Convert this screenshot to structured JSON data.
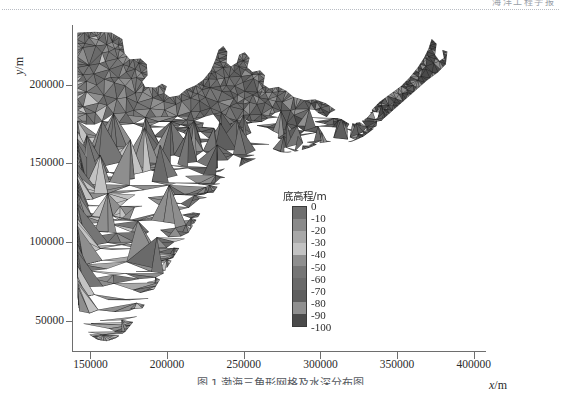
{
  "header": {
    "running_head": "海洋工程学报"
  },
  "figure": {
    "caption": "图 1  渤海三角形网格及水深分布图"
  },
  "axes": {
    "x_axis_title": "x",
    "x_axis_unit": "/m",
    "y_axis_title": "y",
    "y_axis_unit": "/m",
    "x_ticks": [
      "150000",
      "200000",
      "250000",
      "300000",
      "350000",
      "400000"
    ],
    "x_tick_values": [
      150000,
      200000,
      250000,
      300000,
      350000,
      400000
    ],
    "y_ticks": [
      "50000",
      "100000",
      "150000",
      "200000"
    ],
    "y_tick_values": [
      50000,
      100000,
      150000,
      200000
    ],
    "x_range": [
      138000,
      408000
    ],
    "y_range": [
      30000,
      238000
    ]
  },
  "legend": {
    "title": "底高程/m",
    "labels": [
      "0",
      "-10",
      "-20",
      "-30",
      "-40",
      "-50",
      "-60",
      "-70",
      "-80",
      "-90",
      "-100"
    ],
    "values": [
      0,
      -10,
      -20,
      -30,
      -40,
      -50,
      -60,
      -70,
      -80,
      -90,
      -100
    ],
    "colors": [
      "#6f6f6f",
      "#8a8a8a",
      "#a8a8a8",
      "#c2c2c2",
      "#8e8e8e",
      "#757575",
      "#6a6a6a",
      "#5e5e5e",
      "#8f8f8f",
      "#4a4a4a"
    ]
  },
  "chart_data": {
    "type": "mesh",
    "title": "",
    "xlabel": "x/m",
    "ylabel": "y/m",
    "xlim": [
      138000,
      408000
    ],
    "ylim": [
      30000,
      238000
    ],
    "grid": false,
    "legend_position": "inside-center",
    "colorbar": {
      "title": "底高程/m",
      "ticks": [
        0,
        -10,
        -20,
        -30,
        -40,
        -50,
        -60,
        -70,
        -80,
        -90,
        -100
      ],
      "cmap": "gray"
    },
    "domain_outline": [
      [
        141000,
        233000
      ],
      [
        152000,
        233500
      ],
      [
        163000,
        233000
      ],
      [
        170000,
        229000
      ],
      [
        171500,
        220000
      ],
      [
        175000,
        216000
      ],
      [
        182000,
        216500
      ],
      [
        186000,
        213000
      ],
      [
        186500,
        206000
      ],
      [
        183000,
        202000
      ],
      [
        185000,
        198500
      ],
      [
        192000,
        198000
      ],
      [
        196000,
        200500
      ],
      [
        199000,
        199000
      ],
      [
        197500,
        194500
      ],
      [
        201000,
        192000
      ],
      [
        207000,
        193000
      ],
      [
        212000,
        197000
      ],
      [
        218000,
        199500
      ],
      [
        223000,
        203000
      ],
      [
        228000,
        209000
      ],
      [
        231000,
        216000
      ],
      [
        233000,
        222000
      ],
      [
        236000,
        224500
      ],
      [
        238500,
        221000
      ],
      [
        238000,
        214000
      ],
      [
        241000,
        211500
      ],
      [
        245000,
        214000
      ],
      [
        246500,
        219000
      ],
      [
        250000,
        220500
      ],
      [
        253000,
        217000
      ],
      [
        251500,
        211000
      ],
      [
        255000,
        208000
      ],
      [
        260000,
        209000
      ],
      [
        263000,
        206000
      ],
      [
        262000,
        200000
      ],
      [
        266000,
        197500
      ],
      [
        272000,
        198500
      ],
      [
        277000,
        196000
      ],
      [
        282000,
        192000
      ],
      [
        289000,
        190000
      ],
      [
        296000,
        190500
      ],
      [
        303000,
        188000
      ],
      [
        309000,
        184000
      ],
      [
        313000,
        178000
      ],
      [
        318000,
        175000
      ],
      [
        325000,
        176000
      ],
      [
        330000,
        179000
      ],
      [
        333000,
        184000
      ],
      [
        338000,
        189000
      ],
      [
        345000,
        194000
      ],
      [
        352000,
        199000
      ],
      [
        358000,
        205000
      ],
      [
        363000,
        211000
      ],
      [
        367000,
        217000
      ],
      [
        370000,
        223000
      ],
      [
        372000,
        229000
      ],
      [
        375000,
        226000
      ],
      [
        374000,
        219000
      ],
      [
        377000,
        215000
      ],
      [
        380000,
        217000
      ],
      [
        379000,
        222000
      ],
      [
        382000,
        221000
      ],
      [
        381000,
        213000
      ],
      [
        376000,
        208000
      ],
      [
        369000,
        203000
      ],
      [
        362000,
        197000
      ],
      [
        355000,
        191000
      ],
      [
        348000,
        185000
      ],
      [
        341000,
        179000
      ],
      [
        334000,
        172000
      ],
      [
        327000,
        167000
      ],
      [
        320000,
        164000
      ],
      [
        313000,
        163000
      ],
      [
        306000,
        164000
      ],
      [
        299000,
        163000
      ],
      [
        292000,
        160000
      ],
      [
        285000,
        158000
      ],
      [
        278000,
        157000
      ],
      [
        271000,
        157500
      ],
      [
        264000,
        156000
      ],
      [
        257000,
        153000
      ],
      [
        250000,
        150000
      ],
      [
        243000,
        146000
      ],
      [
        237000,
        141000
      ],
      [
        232000,
        135000
      ],
      [
        227000,
        128000
      ],
      [
        222000,
        120000
      ],
      [
        217000,
        112000
      ],
      [
        212000,
        104000
      ],
      [
        207000,
        96000
      ],
      [
        202000,
        88000
      ],
      [
        197000,
        80000
      ],
      [
        192000,
        72000
      ],
      [
        187000,
        64000
      ],
      [
        182000,
        56000
      ],
      [
        177000,
        49000
      ],
      [
        172000,
        43000
      ],
      [
        166000,
        39000
      ],
      [
        160000,
        37000
      ],
      [
        154000,
        38000
      ],
      [
        149000,
        41000
      ],
      [
        146000,
        46000
      ],
      [
        143000,
        52000
      ],
      [
        141500,
        60000
      ],
      [
        141000,
        80000
      ],
      [
        141000,
        110000
      ],
      [
        141000,
        140000
      ],
      [
        141000,
        170000
      ],
      [
        141000,
        200000
      ],
      [
        141000,
        233000
      ]
    ]
  }
}
